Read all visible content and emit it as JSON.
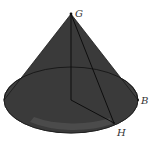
{
  "figure": {
    "type": "cone",
    "labels": {
      "apex": "G",
      "point_b": "B",
      "point_h": "H"
    },
    "colors": {
      "surface": "#3a3a3a",
      "edge": "#111111",
      "label": "#333333",
      "background": "#ffffff"
    },
    "geometry": {
      "apex": [
        71,
        14
      ],
      "base_center": [
        71,
        100
      ],
      "base_rx": 67,
      "base_ry": 33,
      "B": [
        138,
        100
      ],
      "H": [
        114,
        123
      ]
    },
    "segments": [
      "G-O (height)",
      "O-H (radius)",
      "G-H (slant)"
    ]
  }
}
